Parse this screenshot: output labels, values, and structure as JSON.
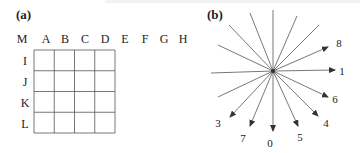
{
  "panel_a": {
    "label": "(a)",
    "column_labels": [
      "M",
      "A",
      "B",
      "C",
      "D",
      "E",
      "F",
      "G",
      "H"
    ],
    "row_labels": [
      "I",
      "J",
      "K",
      "L"
    ],
    "grid": {
      "rows": 4,
      "cols": 4
    }
  },
  "panel_b": {
    "label": "(b)",
    "center": [
      273,
      71
    ],
    "lines": [
      {
        "end": [
          273,
          10
        ],
        "arrow": false,
        "label": ""
      },
      {
        "end": [
          250,
          13
        ],
        "arrow": false,
        "label": ""
      },
      {
        "end": [
          297,
          16
        ],
        "arrow": false,
        "label": ""
      },
      {
        "end": [
          229,
          25
        ],
        "arrow": false,
        "label": ""
      },
      {
        "end": [
          319,
          25
        ],
        "arrow": false,
        "label": ""
      },
      {
        "end": [
          218,
          45
        ],
        "arrow": false,
        "label": ""
      },
      {
        "end": [
          211,
          73
        ],
        "arrow": false,
        "label": ""
      },
      {
        "end": [
          218,
          97
        ],
        "arrow": false,
        "label": ""
      },
      {
        "end": [
          328,
          47
        ],
        "arrow": true,
        "label": "8",
        "label_pos": [
          339,
          47
        ]
      },
      {
        "end": [
          335,
          70
        ],
        "arrow": true,
        "label": "1",
        "label_pos": [
          342,
          75
        ]
      },
      {
        "end": [
          328,
          97
        ],
        "arrow": true,
        "label": "6",
        "label_pos": [
          335,
          103
        ]
      },
      {
        "end": [
          318,
          116
        ],
        "arrow": true,
        "label": "4",
        "label_pos": [
          326,
          127
        ]
      },
      {
        "end": [
          298,
          126
        ],
        "arrow": true,
        "label": "5",
        "label_pos": [
          300,
          141
        ]
      },
      {
        "end": [
          273,
          131
        ],
        "arrow": true,
        "label": "0",
        "label_pos": [
          270,
          147
        ]
      },
      {
        "end": [
          250,
          126
        ],
        "arrow": true,
        "label": "7",
        "label_pos": [
          243,
          142
        ]
      },
      {
        "end": [
          230,
          117
        ],
        "arrow": true,
        "label": "3",
        "label_pos": [
          218,
          127
        ]
      }
    ],
    "line_color": "#555555",
    "arrow_color": "#333333"
  }
}
